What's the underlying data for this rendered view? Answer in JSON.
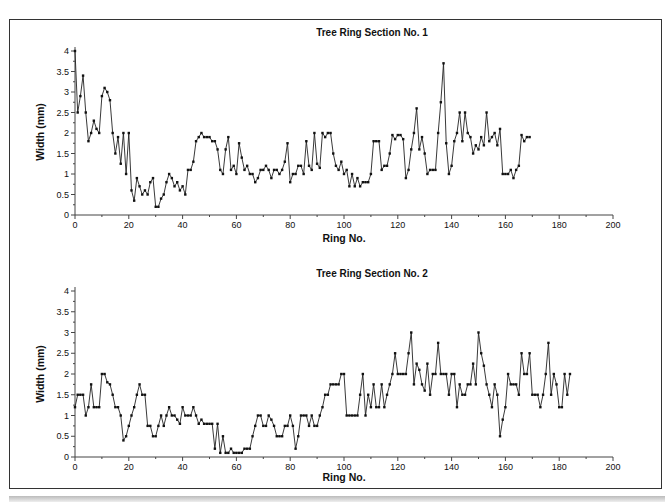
{
  "chart_data": [
    {
      "type": "line",
      "title": "Tree Ring Section No. 1",
      "xlabel": "Ring No.",
      "ylabel": "Width (mm)",
      "xlim": [
        0,
        200
      ],
      "ylim": [
        0,
        4
      ],
      "xticks": [
        0,
        20,
        40,
        60,
        80,
        100,
        120,
        140,
        160,
        180,
        200
      ],
      "yticks": [
        0,
        0.5,
        1,
        1.5,
        2,
        2.5,
        3,
        3.5,
        4
      ],
      "ytick_labels": [
        "0",
        "0.5",
        "1",
        "1.5",
        "2",
        "2.5",
        "3",
        "3.5",
        "4"
      ],
      "grid": false,
      "legend": null,
      "series": [
        {
          "name": "Section 1",
          "x_start": 0,
          "values": [
            4.0,
            2.5,
            2.9,
            3.4,
            2.5,
            1.8,
            2.0,
            2.3,
            2.1,
            2.0,
            2.9,
            3.1,
            3.0,
            2.8,
            2.0,
            1.5,
            1.9,
            1.25,
            2.0,
            1.0,
            2.0,
            0.6,
            0.35,
            0.9,
            0.7,
            0.5,
            0.6,
            0.5,
            0.8,
            0.9,
            0.2,
            0.2,
            0.4,
            0.5,
            0.8,
            1.0,
            0.9,
            0.7,
            0.8,
            0.6,
            0.7,
            0.5,
            1.1,
            1.1,
            1.3,
            1.8,
            1.9,
            2.0,
            1.9,
            1.9,
            1.9,
            1.8,
            1.8,
            1.6,
            1.1,
            1.0,
            1.6,
            1.9,
            1.1,
            1.2,
            1.0,
            1.75,
            1.4,
            1.1,
            1.2,
            1.0,
            1.0,
            0.8,
            0.9,
            1.1,
            1.1,
            1.2,
            1.1,
            0.9,
            1.1,
            1.1,
            1.0,
            1.1,
            1.3,
            1.75,
            0.8,
            1.0,
            1.0,
            1.2,
            1.2,
            1.0,
            1.8,
            1.2,
            1.1,
            2.0,
            1.25,
            1.15,
            2.0,
            1.9,
            2.0,
            2.0,
            1.5,
            1.2,
            1.1,
            1.3,
            1.0,
            1.1,
            0.7,
            1.0,
            0.7,
            0.9,
            0.7,
            0.8,
            0.8,
            0.8,
            1.0,
            1.8,
            1.8,
            1.8,
            1.1,
            1.2,
            1.2,
            1.5,
            1.95,
            1.85,
            1.95,
            1.95,
            1.85,
            0.9,
            1.1,
            1.6,
            2.0,
            2.6,
            1.6,
            1.9,
            1.5,
            1.0,
            1.1,
            1.1,
            1.1,
            2.0,
            2.75,
            3.7,
            1.75,
            1.0,
            1.2,
            1.8,
            2.0,
            2.5,
            1.8,
            2.5,
            2.0,
            1.9,
            1.5,
            1.7,
            1.6,
            1.9,
            1.7,
            2.5,
            1.8,
            1.9,
            2.0,
            1.7,
            2.1,
            1.0,
            1.0,
            1.0,
            1.1,
            0.9,
            1.1,
            1.2,
            1.95,
            1.8,
            1.9,
            1.9
          ]
        }
      ]
    },
    {
      "type": "line",
      "title": "Tree Ring Section No. 2",
      "xlabel": "Ring No.",
      "ylabel": "Width (mm)",
      "xlim": [
        0,
        200
      ],
      "ylim": [
        0,
        4
      ],
      "xticks": [
        0,
        20,
        40,
        60,
        80,
        100,
        120,
        140,
        160,
        180,
        200
      ],
      "yticks": [
        0,
        0.5,
        1,
        1.5,
        2,
        2.5,
        3,
        3.5,
        4
      ],
      "ytick_labels": [
        "0",
        "0.5",
        "1",
        "1.5",
        "2",
        "2.5",
        "3",
        "3.5",
        "4"
      ],
      "grid": false,
      "legend": null,
      "series": [
        {
          "name": "Section 2",
          "x_start": 0,
          "values": [
            1.2,
            1.5,
            1.5,
            1.5,
            1.0,
            1.2,
            1.75,
            1.2,
            1.2,
            1.2,
            2.0,
            2.0,
            1.8,
            1.75,
            1.5,
            1.2,
            1.2,
            1.0,
            0.4,
            0.5,
            0.75,
            1.0,
            1.2,
            1.5,
            1.75,
            1.5,
            1.5,
            0.75,
            0.75,
            0.5,
            0.5,
            0.75,
            1.0,
            0.75,
            1.0,
            1.2,
            1.0,
            1.0,
            0.9,
            0.8,
            1.2,
            1.0,
            1.0,
            1.0,
            1.2,
            1.0,
            0.8,
            0.9,
            0.8,
            0.8,
            0.8,
            0.8,
            0.2,
            0.8,
            0.1,
            0.5,
            0.1,
            0.1,
            0.2,
            0.1,
            0.1,
            0.1,
            0.1,
            0.2,
            0.2,
            0.2,
            0.5,
            0.75,
            1.0,
            1.0,
            0.75,
            0.75,
            1.0,
            0.9,
            0.75,
            0.5,
            0.5,
            0.5,
            0.75,
            0.75,
            1.0,
            0.75,
            0.2,
            0.5,
            1.0,
            1.0,
            1.0,
            0.75,
            1.0,
            0.75,
            0.75,
            1.0,
            1.2,
            1.5,
            1.5,
            1.75,
            1.75,
            1.75,
            1.75,
            2.0,
            2.0,
            1.0,
            1.0,
            1.0,
            1.0,
            1.0,
            1.5,
            2.0,
            1.0,
            1.5,
            1.2,
            1.75,
            1.2,
            1.2,
            1.75,
            1.2,
            1.5,
            1.75,
            2.0,
            2.5,
            2.0,
            2.0,
            2.0,
            2.0,
            2.5,
            3.0,
            1.75,
            2.25,
            2.1,
            1.75,
            1.6,
            2.25,
            1.5,
            2.0,
            2.0,
            2.75,
            2.0,
            2.0,
            2.0,
            1.5,
            2.0,
            2.0,
            1.2,
            1.75,
            1.5,
            1.5,
            1.75,
            1.75,
            2.25,
            1.75,
            3.0,
            2.5,
            2.2,
            1.75,
            1.5,
            1.2,
            1.75,
            1.5,
            0.5,
            0.9,
            1.2,
            2.0,
            1.75,
            1.75,
            1.75,
            1.5,
            2.5,
            2.0,
            2.0,
            2.5,
            1.5,
            1.5,
            1.5,
            1.2,
            1.5,
            2.0,
            2.75,
            1.5,
            2.0,
            1.75,
            1.2,
            1.2,
            2.0,
            1.5,
            2.0
          ]
        }
      ]
    }
  ]
}
